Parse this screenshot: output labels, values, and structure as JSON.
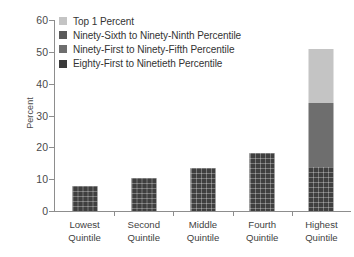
{
  "chart_data": {
    "type": "bar",
    "stacked": true,
    "title": "",
    "xlabel": "",
    "ylabel": "Percent",
    "ylim": [
      0,
      60
    ],
    "yticks": [
      0,
      10,
      20,
      30,
      40,
      50,
      60
    ],
    "grid": false,
    "legend_position": "top-left",
    "categories": [
      "Lowest Quintile",
      "Second Quintile",
      "Middle Quintile",
      "Fourth Quintile",
      "Highest Quintile"
    ],
    "category_lines": [
      [
        "Lowest",
        "Quintile"
      ],
      [
        "Second",
        "Quintile"
      ],
      [
        "Middle",
        "Quintile"
      ],
      [
        "Fourth",
        "Quintile"
      ],
      [
        "Highest",
        "Quintile"
      ]
    ],
    "series": [
      {
        "name": "Eighty-First to Ninetieth Percentile",
        "color": "#3f3f3f",
        "textured": true,
        "values": [
          7.9,
          10.4,
          13.5,
          18.2,
          13.8
        ]
      },
      {
        "name": "Ninety-First to Ninety-Fifth Percentile",
        "color": "#6e6e6e",
        "textured": false,
        "values": [
          0,
          0,
          0,
          0,
          20.1
        ]
      },
      {
        "name": "Ninety-Sixth to Ninety-Ninth Percentile",
        "color": "#5a5a5a",
        "textured": false,
        "values": [
          0,
          0,
          0,
          0,
          0
        ]
      },
      {
        "name": "Top 1  Percent",
        "color": "#c4c4c4",
        "textured": false,
        "values": [
          0,
          0,
          0,
          0,
          17.1
        ]
      }
    ],
    "totals": [
      7.9,
      10.4,
      13.5,
      18.2,
      51.0
    ]
  },
  "legend": {
    "items": [
      {
        "label": "Top 1  Percent",
        "color": "#c4c4c4"
      },
      {
        "label": "Ninety-Sixth to Ninety-Ninth Percentile",
        "color": "#5a5a5a"
      },
      {
        "label": "Ninety-First to Ninety-Fifth Percentile",
        "color": "#6e6e6e"
      },
      {
        "label": "Eighty-First to Ninetieth Percentile",
        "color": "#3a3a3a"
      }
    ]
  },
  "axis": {
    "y_label": "Percent",
    "y_ticks": [
      "60",
      "50",
      "40",
      "30",
      "20",
      "10",
      "0"
    ]
  }
}
